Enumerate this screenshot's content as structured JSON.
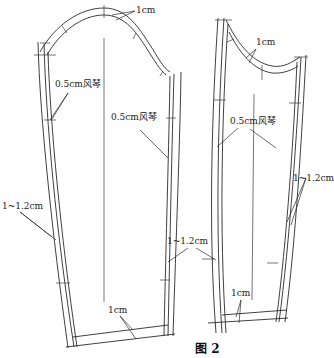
{
  "figure": {
    "caption": "图 2",
    "stroke_color": "#2a2a2a",
    "background": "#ffffff"
  },
  "pieces": [
    {
      "name": "sleeve-front-piece",
      "labels": {
        "cap_allowance": "1cm",
        "left_pleat": "0.5cm风琴",
        "right_pleat": "0.5cm风琴",
        "side_allowance": "1~1.2cm",
        "hem_allowance": "1cm"
      }
    },
    {
      "name": "sleeve-back-piece",
      "labels": {
        "cap_allowance": "1cm",
        "pleat": "0.5cm风琴",
        "left_side_allowance": "1~1.2cm",
        "right_side_allowance": "1~1.2cm",
        "hem_allowance": "1cm"
      }
    }
  ]
}
